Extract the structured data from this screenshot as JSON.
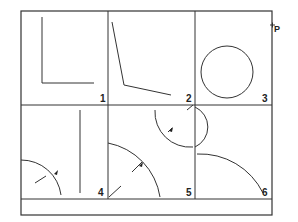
{
  "diagram": {
    "cells": [
      {
        "label": "1",
        "content": "L-shaped right angle"
      },
      {
        "label": "2",
        "content": "obtuse angle"
      },
      {
        "label": "3",
        "content": "circle",
        "marker": "P"
      },
      {
        "label": "4",
        "content": "arc with radius tick and vertical line"
      },
      {
        "label": "5",
        "content": "two arcs with radius arrows"
      },
      {
        "label": "6",
        "content": "arc"
      }
    ],
    "point_label": "P",
    "point_marker": "+",
    "colors": {
      "line": "#333333",
      "background": "#ffffff"
    }
  }
}
